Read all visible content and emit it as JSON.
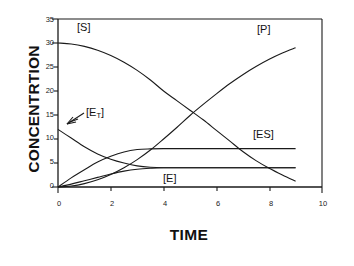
{
  "chart_data": {
    "type": "line",
    "title": "",
    "xlabel": "TIME",
    "ylabel": "CONCENTRTION",
    "xlim": [
      0,
      10
    ],
    "ylim": [
      0,
      35
    ],
    "xticks": [
      "0",
      "2",
      "4",
      "6",
      "8",
      "10"
    ],
    "yticks": [
      "0",
      "5",
      "10",
      "15",
      "20",
      "25",
      "30",
      "35"
    ],
    "grid": false,
    "legend": "inline-annotations",
    "series": [
      {
        "name": "[S]",
        "label": "[S]",
        "x": [
          0,
          0.5,
          1,
          1.5,
          2,
          2.5,
          3,
          3.5,
          4,
          4.5,
          5,
          5.5,
          6,
          6.5,
          7,
          7.5,
          8,
          8.5,
          9
        ],
        "values": [
          30.0,
          29.8,
          29.3,
          28.5,
          27.4,
          26.0,
          24.3,
          22.3,
          20.0,
          18.0,
          16.0,
          14.0,
          11.8,
          9.6,
          7.4,
          5.5,
          3.9,
          2.5,
          1.2
        ]
      },
      {
        "name": "[P]",
        "label": "[P]",
        "x": [
          0,
          0.5,
          1,
          1.5,
          2,
          2.5,
          3,
          3.5,
          4,
          4.5,
          5,
          5.5,
          6,
          6.5,
          7,
          7.5,
          8,
          8.5,
          9
        ],
        "values": [
          0.0,
          0.2,
          0.7,
          1.5,
          2.6,
          4.0,
          5.7,
          7.7,
          10.0,
          12.4,
          14.9,
          17.2,
          19.4,
          21.5,
          23.4,
          25.1,
          26.6,
          27.9,
          29.0
        ]
      },
      {
        "name": "[E_T]",
        "label": "[ET]",
        "label_base": "[E",
        "label_sub": "T",
        "label_close": "]",
        "x": [
          0,
          0.5,
          1,
          1.5,
          2,
          2.5,
          3,
          3.5,
          4,
          5,
          6,
          7,
          8,
          9
        ],
        "values": [
          12.0,
          10.2,
          8.4,
          6.9,
          5.8,
          5.0,
          4.4,
          4.1,
          4.0,
          4.0,
          4.0,
          4.0,
          4.0,
          4.0
        ]
      },
      {
        "name": "[ES]",
        "label": "[ES]",
        "x": [
          0,
          0.5,
          1,
          1.5,
          2,
          2.5,
          3,
          3.5,
          4,
          5,
          6,
          7,
          8,
          9
        ],
        "values": [
          0.0,
          1.9,
          3.6,
          5.2,
          6.4,
          7.3,
          7.8,
          7.95,
          8.0,
          8.0,
          8.0,
          8.0,
          8.0,
          8.0
        ]
      },
      {
        "name": "[E]",
        "label": "[E]",
        "x": [
          0,
          0.5,
          1,
          1.5,
          2,
          2.5,
          3,
          3.5,
          4,
          5,
          6,
          7,
          8,
          9
        ],
        "values": [
          0.0,
          0.6,
          1.3,
          2.0,
          2.7,
          3.3,
          3.7,
          3.9,
          4.0,
          4.0,
          4.0,
          4.0,
          4.0,
          4.0
        ]
      }
    ],
    "annotations": [
      {
        "name": "s-label",
        "text": "[S]",
        "x": 1.4,
        "y": 32.5
      },
      {
        "name": "p-label",
        "text": "[P]",
        "x": 8.2,
        "y": 32.0
      },
      {
        "name": "et-label",
        "text": "[ET]",
        "x": 1.6,
        "y": 16.5
      },
      {
        "name": "es-label",
        "text": "[ES]",
        "x": 8.0,
        "y": 11.5
      },
      {
        "name": "e-label",
        "text": "[E]",
        "x": 4.9,
        "y": 1.8
      },
      {
        "name": "et-arrow",
        "text": "arrow pointing to E_T curve start",
        "x": 0.9,
        "y": 13.5
      }
    ],
    "colors": {
      "axis": "#1a1a1a",
      "curve": "#1a1a1a",
      "background": "#ffffff"
    }
  },
  "axis_labels": {
    "y": "CONCENTRTION",
    "x": "TIME"
  }
}
